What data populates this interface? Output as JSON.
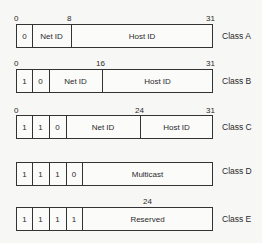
{
  "classes": [
    {
      "name": "Class A",
      "bit_labels": [
        "0",
        "8",
        "31"
      ],
      "fields": [
        "0",
        "Net ID",
        "Host ID"
      ]
    },
    {
      "name": "Class B",
      "bit_labels": [
        "0",
        "16",
        "31"
      ],
      "fields": [
        "1",
        "0",
        "Net ID",
        "Host ID"
      ]
    },
    {
      "name": "Class C",
      "bit_labels": [
        "0",
        "24",
        "31"
      ],
      "fields": [
        "1",
        "1",
        "0",
        "Net ID",
        "Host ID"
      ]
    },
    {
      "name": "Class D",
      "bit_labels": [],
      "fields": [
        "1",
        "1",
        "1",
        "0",
        "Multicast"
      ]
    },
    {
      "name": "Class E",
      "bit_labels": [
        "24"
      ],
      "fields": [
        "1",
        "1",
        "1",
        "1",
        "Reserved"
      ]
    }
  ]
}
